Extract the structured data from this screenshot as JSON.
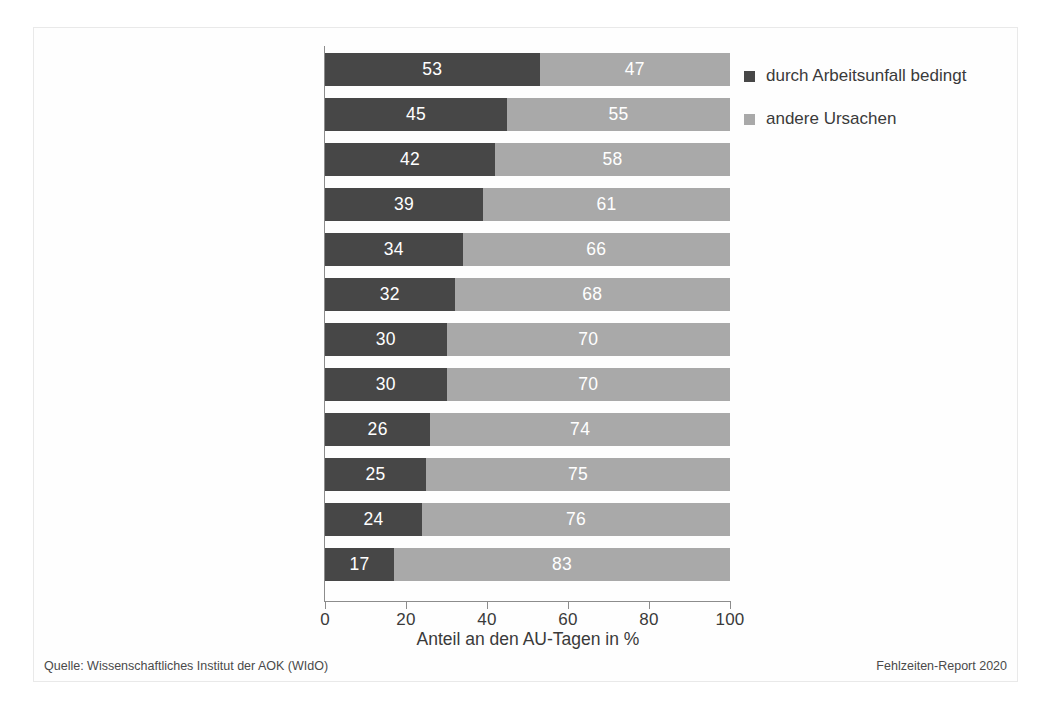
{
  "chart_data": {
    "type": "bar",
    "orientation": "horizontal",
    "stacked": true,
    "stacked_total": 100,
    "title": "",
    "xlabel": "Anteil an den AU-Tagen in %",
    "ylabel": "",
    "xlim": [
      0,
      100
    ],
    "xticks": [
      0,
      20,
      40,
      60,
      80,
      100
    ],
    "xtick_labels": [
      "0",
      "20",
      "40",
      "60",
      "80",
      "100"
    ],
    "grid": false,
    "legend_position": "top-right",
    "categories": [
      "Land- und Forstwirtschaft",
      "Baugewerbe",
      "Verkehr/Transport",
      "Energie/Wasser/\nEntsorgung/Bergbau",
      "Verarbeitendes Gewerbe",
      "Dienstleistungen",
      "Handel",
      "Metallindustrie",
      "Öffentl. Verwaltung/\nSozialversicherung",
      "Erziehung und Unterricht",
      "Gesundheits- und Sozialwesen",
      "Banken/Versicherungen"
    ],
    "series": [
      {
        "name": "durch Arbeitsunfall bedingt",
        "color": "#474747",
        "values": [
          53,
          45,
          42,
          39,
          34,
          32,
          30,
          30,
          26,
          25,
          24,
          17
        ]
      },
      {
        "name": "andere Ursachen",
        "color": "#a9a9a9",
        "values": [
          47,
          55,
          58,
          61,
          66,
          68,
          70,
          70,
          74,
          75,
          76,
          83
        ]
      }
    ]
  },
  "legend": {
    "items": [
      {
        "label": "durch Arbeitsunfall bedingt",
        "color": "#474747"
      },
      {
        "label": "andere Ursachen",
        "color": "#a9a9a9"
      }
    ]
  },
  "footer": {
    "source": "Quelle: Wissenschaftliches Institut der AOK (WIdO)",
    "report": "Fehlzeiten-Report 2020"
  },
  "axis": {
    "x_title": "Anteil an den AU-Tagen in %",
    "x_tick_labels": [
      "0",
      "20",
      "40",
      "60",
      "80",
      "100"
    ]
  }
}
